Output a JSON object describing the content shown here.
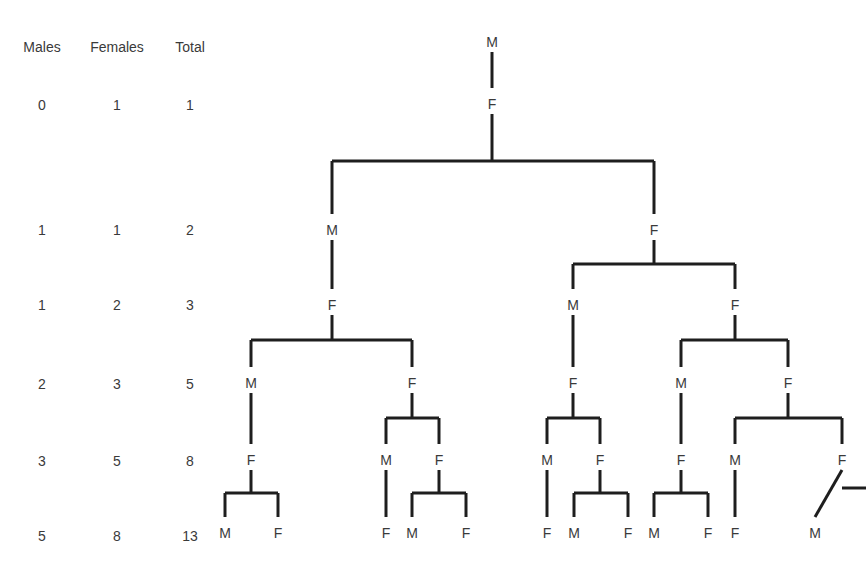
{
  "table": {
    "headers": [
      "Males",
      "Females",
      "Total"
    ],
    "rows": [
      [
        "0",
        "1",
        "1"
      ],
      [
        "1",
        "1",
        "2"
      ],
      [
        "1",
        "2",
        "3"
      ],
      [
        "2",
        "3",
        "5"
      ],
      [
        "3",
        "5",
        "8"
      ],
      [
        "5",
        "8",
        "13"
      ]
    ]
  },
  "tree": {
    "title": "Bee family tree (drone ancestry)",
    "nodes": [
      {
        "id": "n0",
        "label": "M",
        "gen": 0,
        "parent": null
      },
      {
        "id": "n1",
        "label": "F",
        "gen": 1,
        "parent": "n0"
      },
      {
        "id": "n2",
        "label": "M",
        "gen": 2,
        "parent": "n1"
      },
      {
        "id": "n3",
        "label": "F",
        "gen": 2,
        "parent": "n1"
      },
      {
        "id": "n4",
        "label": "F",
        "gen": 3,
        "parent": "n2"
      },
      {
        "id": "n5",
        "label": "M",
        "gen": 3,
        "parent": "n3"
      },
      {
        "id": "n6",
        "label": "F",
        "gen": 3,
        "parent": "n3"
      },
      {
        "id": "n7",
        "label": "M",
        "gen": 4,
        "parent": "n4"
      },
      {
        "id": "n8",
        "label": "F",
        "gen": 4,
        "parent": "n4"
      },
      {
        "id": "n9",
        "label": "F",
        "gen": 4,
        "parent": "n5"
      },
      {
        "id": "n10",
        "label": "M",
        "gen": 4,
        "parent": "n6"
      },
      {
        "id": "n11",
        "label": "F",
        "gen": 4,
        "parent": "n6"
      },
      {
        "id": "n12",
        "label": "F",
        "gen": 5,
        "parent": "n7"
      },
      {
        "id": "n13",
        "label": "M",
        "gen": 5,
        "parent": "n8"
      },
      {
        "id": "n14",
        "label": "F",
        "gen": 5,
        "parent": "n8"
      },
      {
        "id": "n15",
        "label": "M",
        "gen": 5,
        "parent": "n9"
      },
      {
        "id": "n16",
        "label": "F",
        "gen": 5,
        "parent": "n9"
      },
      {
        "id": "n17",
        "label": "F",
        "gen": 5,
        "parent": "n10"
      },
      {
        "id": "n18",
        "label": "M",
        "gen": 5,
        "parent": "n11"
      },
      {
        "id": "n19",
        "label": "F",
        "gen": 5,
        "parent": "n11"
      },
      {
        "id": "n20",
        "label": "M",
        "gen": 6,
        "parent": "n12"
      },
      {
        "id": "n21",
        "label": "F",
        "gen": 6,
        "parent": "n12"
      },
      {
        "id": "n22",
        "label": "F",
        "gen": 6,
        "parent": "n13"
      },
      {
        "id": "n23",
        "label": "M",
        "gen": 6,
        "parent": "n14"
      },
      {
        "id": "n24",
        "label": "F",
        "gen": 6,
        "parent": "n14"
      },
      {
        "id": "n25",
        "label": "F",
        "gen": 6,
        "parent": "n15"
      },
      {
        "id": "n26",
        "label": "M",
        "gen": 6,
        "parent": "n16"
      },
      {
        "id": "n27",
        "label": "F",
        "gen": 6,
        "parent": "n16"
      },
      {
        "id": "n28",
        "label": "M",
        "gen": 6,
        "parent": "n17"
      },
      {
        "id": "n29",
        "label": "F",
        "gen": 6,
        "parent": "n17"
      },
      {
        "id": "n30",
        "label": "F",
        "gen": 6,
        "parent": "n18"
      },
      {
        "id": "n31",
        "label": "M",
        "gen": 6,
        "parent": "n19"
      }
    ]
  }
}
